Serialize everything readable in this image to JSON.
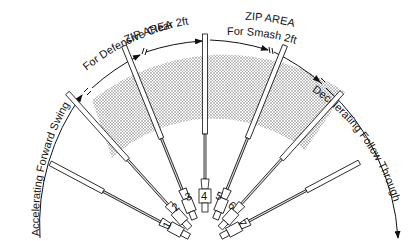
{
  "diagram": {
    "zones": [
      {
        "id": "accelerating",
        "label": "Accelerating Forward Swing"
      },
      {
        "id": "zip_clear",
        "title": "ZIP AREA",
        "subtitle": "For Defensive Clear 2ft"
      },
      {
        "id": "zip_smash",
        "title": "ZIP AREA",
        "subtitle": "For Smash 2ft"
      },
      {
        "id": "decelerating",
        "label": "Decelerating Follow Through"
      }
    ],
    "positions": [
      "1",
      "2",
      "3",
      "4",
      "5",
      "6",
      "7"
    ],
    "colors": {
      "ink": "#111111",
      "shade": "#bdbdbd"
    }
  }
}
